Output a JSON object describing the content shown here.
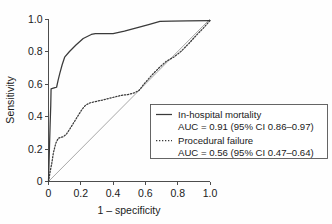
{
  "chart_data": {
    "type": "line",
    "title": "",
    "xlabel": "1 – specificity",
    "ylabel": "Sensitivity",
    "xlim": [
      0,
      1
    ],
    "ylim": [
      0,
      1
    ],
    "grid": false,
    "legend_position": "lower-right",
    "xticks": [
      "0",
      "0.2",
      "0.4",
      "0.6",
      "0.8",
      "1.0"
    ],
    "xtick_values": [
      0,
      0.2,
      0.4,
      0.6,
      0.8,
      1.0
    ],
    "yticks": [
      "0",
      "0.2",
      "0.4",
      "0.6",
      "0.8",
      "1.0"
    ],
    "ytick_values": [
      0,
      0.2,
      0.4,
      0.6,
      0.8,
      1.0
    ],
    "reference_line": {
      "name": "chance-diagonal",
      "x": [
        0,
        1
      ],
      "y": [
        0,
        1
      ],
      "color": "#a8a8a8"
    },
    "series": [
      {
        "name": "In-hospital mortality",
        "style": "solid",
        "color": "#3a3a3a",
        "auc": "0.91",
        "ci_low": "0.86",
        "ci_high": "0.97",
        "auc_label": "AUC = 0.91 (95% CI 0.86–0.97)",
        "x": [
          0.0,
          0.01,
          0.014,
          0.016,
          0.02,
          0.03,
          0.04,
          0.05,
          0.06,
          0.07,
          0.085,
          0.1,
          0.13,
          0.17,
          0.215,
          0.265,
          0.29,
          0.33,
          0.4,
          0.47,
          0.545,
          0.62,
          0.69,
          0.76,
          0.86,
          1.0
        ],
        "y": [
          0.0,
          0.35,
          0.47,
          0.57,
          0.572,
          0.575,
          0.578,
          0.58,
          0.625,
          0.665,
          0.72,
          0.765,
          0.8,
          0.84,
          0.88,
          0.905,
          0.91,
          0.91,
          0.91,
          0.925,
          0.945,
          0.965,
          0.985,
          0.987,
          0.988,
          0.99
        ]
      },
      {
        "name": "Procedural failure",
        "style": "dotted",
        "color": "#3a3a3a",
        "auc": "0.56",
        "ci_low": "0.47",
        "ci_high": "0.64",
        "auc_label": "AUC = 0.56 (95% CI 0.47–0.64)",
        "x": [
          0.0,
          0.01,
          0.02,
          0.03,
          0.045,
          0.06,
          0.075,
          0.09,
          0.11,
          0.13,
          0.155,
          0.18,
          0.205,
          0.23,
          0.255,
          0.29,
          0.33,
          0.37,
          0.41,
          0.45,
          0.49,
          0.53,
          0.56,
          0.6,
          0.645,
          0.69,
          0.73,
          0.775,
          0.82,
          0.87,
          0.92,
          0.96,
          1.0
        ],
        "y": [
          0.0,
          0.06,
          0.11,
          0.175,
          0.235,
          0.265,
          0.272,
          0.275,
          0.29,
          0.32,
          0.36,
          0.4,
          0.44,
          0.47,
          0.483,
          0.492,
          0.5,
          0.51,
          0.52,
          0.53,
          0.535,
          0.545,
          0.56,
          0.61,
          0.66,
          0.705,
          0.74,
          0.765,
          0.8,
          0.85,
          0.905,
          0.945,
          0.99
        ]
      }
    ]
  },
  "legend": {
    "entries": [
      {
        "sample": "solid-line-sample",
        "label": "In-hospital mortality",
        "auc_label": "AUC = 0.91 (95% CI 0.86–0.97)"
      },
      {
        "sample": "dotted-line-sample",
        "label": "Procedural failure",
        "auc_label": "AUC = 0.56 (95% CI 0.47–0.64)"
      }
    ]
  }
}
